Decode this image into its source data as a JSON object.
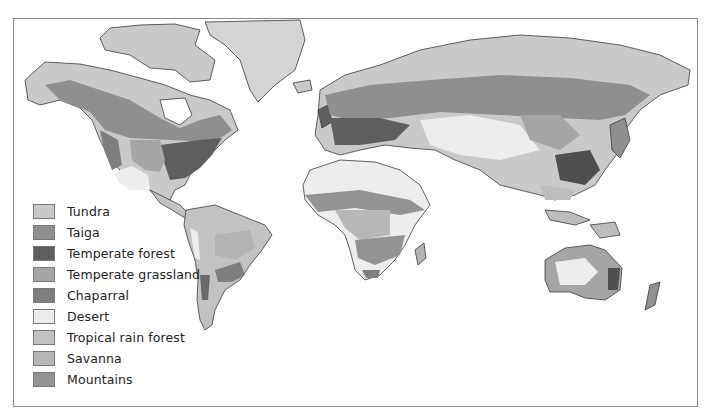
{
  "map": {
    "title": "World biomes",
    "colors": {
      "tundra": "#c9c9c9",
      "taiga": "#8f8f8f",
      "temperate_forest": "#6a6a6a",
      "temperate_grassland": "#a9a9a9",
      "chaparral": "#7e7e7e",
      "desert": "#ececec",
      "tropical_rain_forest": "#bdbdbd",
      "savanna": "#b3b3b3",
      "mountains": "#949494",
      "ice": "#d4d4d4",
      "coast": "#3a3a3a"
    }
  },
  "legend": {
    "items": [
      {
        "label": "Tundra",
        "color": "#c9c9c9"
      },
      {
        "label": "Taiga",
        "color": "#8f8f8f"
      },
      {
        "label": "Temperate forest",
        "color": "#5e5e5e"
      },
      {
        "label": "Temperate grassland",
        "color": "#a5a5a5"
      },
      {
        "label": "Chaparral",
        "color": "#7e7e7e"
      },
      {
        "label": "Desert",
        "color": "#ededed"
      },
      {
        "label": "Tropical rain forest",
        "color": "#c2c2c2"
      },
      {
        "label": "Savanna",
        "color": "#b7b7b7"
      },
      {
        "label": "Mountains",
        "color": "#939393"
      }
    ]
  }
}
